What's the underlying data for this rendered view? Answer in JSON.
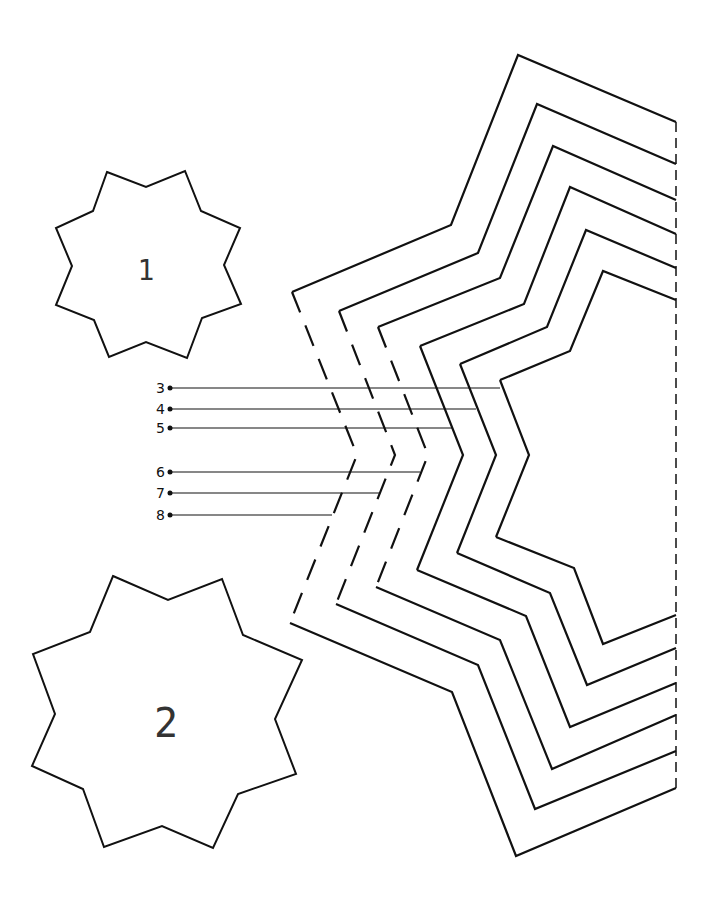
{
  "stars": [
    {
      "label": "1",
      "points": "107,172 146,187 185,171 201,211 240,228 224,265 241,304 202,318 187,358 146,342 109,357 94,320 56,305 72,266 56,228 93,211",
      "label_x": 146,
      "label_y": 272,
      "font_size": 28
    },
    {
      "label": "2",
      "points": "113,576 168,600 222,579 243,635 302,660 275,719 296,774 238,794 213,848 162,826 104,847 83,789 32,766 55,714 33,654 90,632",
      "label_x": 166,
      "label_y": 726,
      "font_size": 40
    }
  ],
  "outlines": [
    {
      "id": "8",
      "points": "676,122 518,55 451,225 292,292 357,455 290,623 452,692 516,856 676,788",
      "label_y": 515,
      "line_end_x": 332
    },
    {
      "id": "7",
      "points": "676,164 537,104 478,253 339,311 395,455 336,604 478,665 535,809 676,751",
      "label_y": 493,
      "line_end_x": 380
    },
    {
      "id": "6",
      "points": "676,200 553,146 500,278 378,327 428,455 376,587 500,640 552,769 676,715",
      "label_y": 472,
      "line_end_x": 420
    },
    {
      "id": "5",
      "points": "676,234 570,187 524,304 420,346 463,455 417,570 526,616 570,727 676,683",
      "label_y": 428,
      "line_end_x": 452
    },
    {
      "id": "4",
      "points": "676,268 586,230 547,327 460,364 496,455 457,553 550,593 587,685 676,648",
      "label_y": 409,
      "line_end_x": 476
    },
    {
      "id": "3",
      "points": "676,300 603,271 570,351 500,380 529,455 496,537 574,568 603,644 676,615",
      "label_y": 388,
      "line_end_x": 500
    }
  ],
  "fold_line": {
    "x": 676,
    "y1": 122,
    "y2": 788
  },
  "leader_start_x": 170,
  "colors": {
    "stroke": "#111111",
    "background": "#ffffff"
  }
}
